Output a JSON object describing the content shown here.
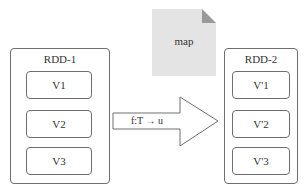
{
  "diagram": {
    "document": {
      "label": "map",
      "fill": "#e4e4e4",
      "fold_color": "#9a9a9a"
    },
    "source_rdd": {
      "title": "RDD-1",
      "partitions": [
        "V1",
        "V2",
        "V3"
      ]
    },
    "target_rdd": {
      "title": "RDD-2",
      "partitions": [
        "V'1",
        "V'2",
        "V'3"
      ]
    },
    "arrow": {
      "label": "f:T → u"
    },
    "colors": {
      "border": "#6e6e6e",
      "text": "#333333",
      "background": "#ffffff"
    }
  }
}
